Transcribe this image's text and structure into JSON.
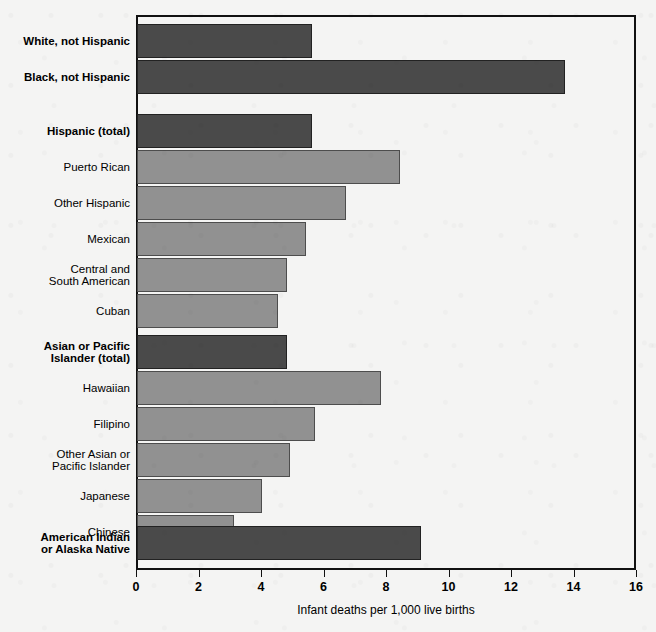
{
  "chart": {
    "type": "bar",
    "orientation": "horizontal",
    "xlabel": "Infant deaths per 1,000 live births",
    "ylabel": "",
    "title": "",
    "xlim": [
      0,
      16
    ],
    "xticks": [
      0,
      2,
      4,
      6,
      8,
      10,
      12,
      14,
      16
    ],
    "grid": false,
    "frame": true,
    "colors": {
      "total_bar": "#4a4a4a",
      "subgroup_bar": "#919191",
      "bar_outline": "#2b2b2b",
      "frame": "#111111",
      "background": "#f4f4f3",
      "text": "#000000"
    }
  },
  "chart_data": {
    "type": "bar",
    "title": "",
    "xlabel": "Infant deaths per 1,000 live births",
    "ylabel": "",
    "xlim": [
      0,
      16
    ],
    "xticks": [
      "0",
      "2",
      "4",
      "6",
      "8",
      "10",
      "12",
      "14",
      "16"
    ],
    "grid": false,
    "legend": null,
    "orientation": "horizontal",
    "categories": [
      "White, not Hispanic",
      "Black, not Hispanic",
      "Hispanic (total)",
      "Puerto Rican",
      "Other Hispanic",
      "Mexican",
      "Central and\nSouth American",
      "Cuban",
      "Asian or Pacific\nIslander (total)",
      "Hawaiian",
      "Filipino",
      "Other Asian or\nPacific Islander",
      "Japanese",
      "Chinese",
      "American Indian\nor Alaska Native"
    ],
    "values": [
      5.6,
      13.7,
      5.6,
      8.4,
      6.7,
      5.4,
      4.8,
      4.5,
      4.8,
      7.8,
      5.7,
      4.9,
      4.0,
      3.1,
      9.1
    ]
  },
  "rows": [
    {
      "label": "White, not Hispanic",
      "value": 5.6,
      "style": "dark",
      "bold": true,
      "top": 9,
      "height": 34,
      "gap_after": 0
    },
    {
      "label": "Black, not Hispanic",
      "value": 13.7,
      "style": "dark",
      "bold": true,
      "top": 45,
      "height": 34,
      "gap_after": 1
    },
    {
      "label": "Hispanic (total)",
      "value": 5.6,
      "style": "dark",
      "bold": true,
      "top": 99,
      "height": 34,
      "gap_after": 0
    },
    {
      "label": "Puerto Rican",
      "value": 8.4,
      "style": "light",
      "bold": false,
      "top": 135,
      "height": 34,
      "gap_after": 0
    },
    {
      "label": "Other Hispanic",
      "value": 6.7,
      "style": "light",
      "bold": false,
      "top": 171,
      "height": 34,
      "gap_after": 0
    },
    {
      "label": "Mexican",
      "value": 5.4,
      "style": "light",
      "bold": false,
      "top": 207,
      "height": 34,
      "gap_after": 0
    },
    {
      "label": "Central and\nSouth American",
      "value": 4.8,
      "style": "light",
      "bold": false,
      "top": 243,
      "height": 34,
      "gap_after": 0
    },
    {
      "label": "Cuban",
      "value": 4.5,
      "style": "light",
      "bold": false,
      "top": 279,
      "height": 34,
      "gap_after": 1
    },
    {
      "label": "Asian or Pacific\nIslander (total)",
      "value": 4.8,
      "style": "dark",
      "bold": true,
      "top": 320,
      "height": 34,
      "gap_after": 0
    },
    {
      "label": "Hawaiian",
      "value": 7.8,
      "style": "light",
      "bold": false,
      "top": 356,
      "height": 34,
      "gap_after": 0
    },
    {
      "label": "Filipino",
      "value": 5.7,
      "style": "light",
      "bold": false,
      "top": 392,
      "height": 34,
      "gap_after": 0
    },
    {
      "label": "Other Asian or\nPacific Islander",
      "value": 4.9,
      "style": "light",
      "bold": false,
      "top": 428,
      "height": 34,
      "gap_after": 0
    },
    {
      "label": "Japanese",
      "value": 4.0,
      "style": "light",
      "bold": false,
      "top": 464,
      "height": 34,
      "gap_after": 0
    },
    {
      "label": "Chinese",
      "value": 3.1,
      "style": "light",
      "bold": false,
      "top": 500,
      "height": 34,
      "gap_after": 1
    },
    {
      "label": "American Indian\nor Alaska Native",
      "value": 9.1,
      "style": "dark",
      "bold": true,
      "top": 511,
      "height": 34,
      "gap_after": 0
    }
  ]
}
